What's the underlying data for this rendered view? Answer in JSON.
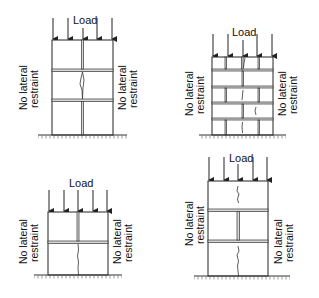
{
  "figure": {
    "panels": [
      {
        "id": "panel-a",
        "load_label": "Load",
        "left_label": [
          "No lateral",
          "restraint"
        ],
        "right_label": [
          "No lateral",
          "restraint"
        ],
        "description": "Three courses of large blocks with central vertical joint; crack in middle course"
      },
      {
        "id": "panel-b",
        "load_label": "Load",
        "left_label": [
          "No lateral",
          "restraint"
        ],
        "right_label": [
          "No lateral",
          "restraint"
        ],
        "description": "Five courses of stretcher-bond brickwork; cracks through centre"
      },
      {
        "id": "panel-c",
        "load_label": "Load",
        "left_label": [
          "No lateral",
          "restraint"
        ],
        "right_label": [
          "No lateral",
          "restraint"
        ],
        "description": "Two courses; vertical joint in top course, crack in bottom course"
      },
      {
        "id": "panel-d",
        "load_label": "Load",
        "left_label": [
          "No lateral",
          "restraint"
        ],
        "right_label": [
          "No lateral",
          "restraint"
        ],
        "description": "Three courses; vertical joint in middle course, cracks in top and bottom courses"
      }
    ],
    "colors": {
      "line": "#222222",
      "mortar": "#d8d8d8",
      "background": "#ffffff"
    }
  }
}
